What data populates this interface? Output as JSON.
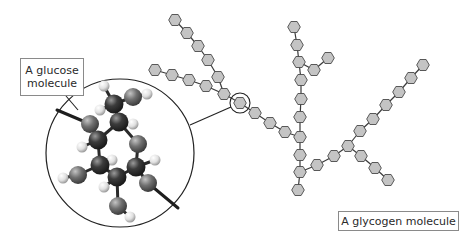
{
  "labels": {
    "glucose": "A glucose molecule",
    "glucose_line1": "A glucose",
    "glucose_line2": "molecule",
    "glycogen": "A glycogen molecule"
  },
  "colors": {
    "hexagon_fill": "#c4c4c4",
    "hexagon_stroke": "#4a4a4a",
    "carbon": "#3a3a3a",
    "oxygen": "#6e6e6e",
    "hydrogen": "#e8e8e8",
    "line": "#222222"
  },
  "glycogen": {
    "units": [
      [
        175,
        20
      ],
      [
        187,
        33
      ],
      [
        198,
        46
      ],
      [
        208,
        60
      ],
      [
        218,
        77
      ],
      [
        155,
        70
      ],
      [
        172,
        75
      ],
      [
        189,
        80
      ],
      [
        206,
        86
      ],
      [
        224,
        94
      ],
      [
        240,
        103
      ],
      [
        255,
        113
      ],
      [
        270,
        123
      ],
      [
        285,
        132
      ],
      [
        294,
        27
      ],
      [
        297,
        45
      ],
      [
        299,
        62
      ],
      [
        301,
        80
      ],
      [
        301,
        99
      ],
      [
        300,
        117
      ],
      [
        300,
        137
      ],
      [
        300,
        155
      ],
      [
        300,
        172
      ],
      [
        298,
        190
      ],
      [
        314,
        70
      ],
      [
        328,
        58
      ],
      [
        317,
        165
      ],
      [
        334,
        156
      ],
      [
        348,
        146
      ],
      [
        360,
        131
      ],
      [
        373,
        119
      ],
      [
        386,
        105
      ],
      [
        399,
        92
      ],
      [
        411,
        78
      ],
      [
        423,
        65
      ],
      [
        361,
        156
      ],
      [
        375,
        168
      ],
      [
        388,
        180
      ]
    ],
    "bonds": [
      [
        0,
        1
      ],
      [
        1,
        2
      ],
      [
        2,
        3
      ],
      [
        3,
        4
      ],
      [
        4,
        9
      ],
      [
        5,
        6
      ],
      [
        6,
        7
      ],
      [
        7,
        8
      ],
      [
        8,
        9
      ],
      [
        9,
        10
      ],
      [
        10,
        11
      ],
      [
        11,
        12
      ],
      [
        12,
        13
      ],
      [
        13,
        20
      ],
      [
        14,
        15
      ],
      [
        15,
        16
      ],
      [
        16,
        17
      ],
      [
        17,
        18
      ],
      [
        18,
        19
      ],
      [
        19,
        20
      ],
      [
        20,
        21
      ],
      [
        21,
        22
      ],
      [
        22,
        23
      ],
      [
        16,
        24
      ],
      [
        24,
        25
      ],
      [
        22,
        26
      ],
      [
        26,
        27
      ],
      [
        27,
        28
      ],
      [
        28,
        29
      ],
      [
        29,
        30
      ],
      [
        30,
        31
      ],
      [
        31,
        32
      ],
      [
        32,
        33
      ],
      [
        33,
        34
      ],
      [
        28,
        35
      ],
      [
        35,
        36
      ],
      [
        36,
        37
      ]
    ],
    "highlighted_unit": 10
  },
  "glucose_model": {
    "atoms": [
      {
        "type": "C",
        "x": 114,
        "y": 104
      },
      {
        "type": "O",
        "x": 133,
        "y": 97
      },
      {
        "type": "H",
        "x": 147,
        "y": 94
      },
      {
        "type": "H",
        "x": 104,
        "y": 86
      },
      {
        "type": "H",
        "x": 100,
        "y": 110
      },
      {
        "type": "C",
        "x": 119,
        "y": 122
      },
      {
        "type": "H",
        "x": 133,
        "y": 124
      },
      {
        "type": "O",
        "x": 90,
        "y": 124
      },
      {
        "type": "C",
        "x": 98,
        "y": 140
      },
      {
        "type": "H",
        "x": 82,
        "y": 147
      },
      {
        "type": "O",
        "x": 138,
        "y": 144
      },
      {
        "type": "C",
        "x": 100,
        "y": 165
      },
      {
        "type": "H",
        "x": 112,
        "y": 160
      },
      {
        "type": "O",
        "x": 78,
        "y": 175
      },
      {
        "type": "H",
        "x": 63,
        "y": 178
      },
      {
        "type": "C",
        "x": 136,
        "y": 167
      },
      {
        "type": "H",
        "x": 155,
        "y": 160
      },
      {
        "type": "C",
        "x": 117,
        "y": 177
      },
      {
        "type": "H",
        "x": 104,
        "y": 187
      },
      {
        "type": "O",
        "x": 148,
        "y": 183
      },
      {
        "type": "O",
        "x": 118,
        "y": 206
      },
      {
        "type": "H",
        "x": 130,
        "y": 217
      }
    ],
    "bonds": [
      [
        0,
        1
      ],
      [
        1,
        2
      ],
      [
        0,
        3
      ],
      [
        0,
        4
      ],
      [
        0,
        5
      ],
      [
        5,
        6
      ],
      [
        5,
        10
      ],
      [
        5,
        8
      ],
      [
        8,
        9
      ],
      [
        8,
        7
      ],
      [
        8,
        11
      ],
      [
        11,
        12
      ],
      [
        11,
        13
      ],
      [
        13,
        14
      ],
      [
        11,
        17
      ],
      [
        10,
        15
      ],
      [
        15,
        16
      ],
      [
        15,
        17
      ],
      [
        15,
        19
      ],
      [
        17,
        18
      ],
      [
        17,
        20
      ],
      [
        20,
        21
      ]
    ],
    "glycosidic_links": [
      [
        90,
        124,
        57,
        110
      ],
      [
        148,
        183,
        178,
        208
      ]
    ]
  },
  "zoom_circle": {
    "cx": 120,
    "cy": 153,
    "r": 74
  },
  "small_circle": {
    "cx": 240,
    "cy": 103,
    "r": 10
  },
  "connector": [
    190,
    125,
    231,
    107
  ],
  "glucose_pointer": [
    66,
    96,
    78,
    110
  ]
}
